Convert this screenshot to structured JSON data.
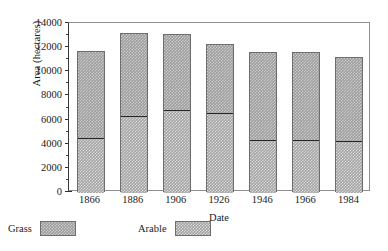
{
  "chart_data": {
    "type": "bar",
    "title": "",
    "subtitle": "",
    "xlabel": "Date",
    "ylabel": "Area (hectares)",
    "categories": [
      "1866",
      "1886",
      "1906",
      "1926",
      "1946",
      "1966",
      "1984"
    ],
    "series": [
      {
        "name": "Grass",
        "values": [
          7150,
          6800,
          6200,
          5700,
          7200,
          7200,
          6900
        ]
      },
      {
        "name": "Arable",
        "values": [
          4550,
          6400,
          6900,
          6600,
          4400,
          4400,
          4300
        ]
      }
    ],
    "totals": [
      11700,
      13200,
      13100,
      12300,
      11600,
      11600,
      11200
    ],
    "stacked": true,
    "stack_order_bottom_to_top": [
      "Arable",
      "Grass"
    ],
    "ylim": [
      0,
      14000
    ],
    "xlim_note": "categorical",
    "y_major_ticks": [
      0,
      2000,
      4000,
      6000,
      8000,
      10000,
      12000,
      14000
    ],
    "y_minor_ticks": [
      1000,
      3000,
      5000,
      7000,
      9000,
      11000,
      13000
    ],
    "y_tick_labels": [
      "0",
      "2000",
      "4000",
      "6000",
      "8000",
      "10000",
      "12000",
      "14000"
    ],
    "grid": false,
    "legend_position": "below-left",
    "colors": {
      "grass_fill": "#9c9c9c",
      "arable_fill": "#a3a3a3",
      "bar_edge": "#6d6d6d",
      "divider": "#262626",
      "axis": "#2e2e2e",
      "frame": "#8e8e8e",
      "background": "#ffffff",
      "text": "#1c1c1c"
    }
  },
  "legend": {
    "items": [
      {
        "label": "Grass"
      },
      {
        "label": "Arable"
      }
    ]
  },
  "axes": {
    "y_title": "Area (hectares)",
    "x_title": "Date"
  }
}
